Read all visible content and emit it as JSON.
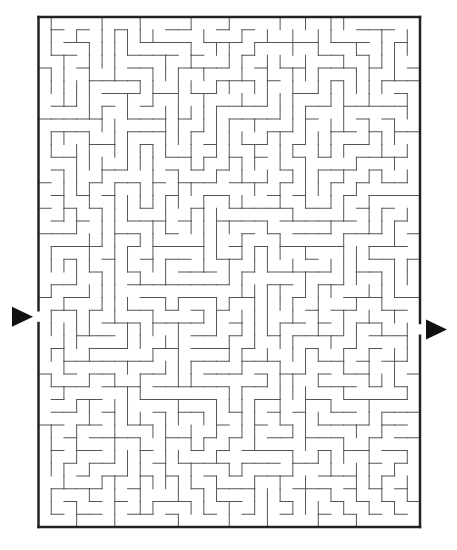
{
  "puzzle": {
    "type": "maze",
    "cols": 30,
    "rows": 40,
    "seed": 7341,
    "border": {
      "left": 38.5,
      "top": 17,
      "right": 420,
      "bottom": 527,
      "color": "#222222",
      "width": 2.5
    },
    "wall_color": "#555555",
    "wall_width": 1,
    "entrance": {
      "side": "left",
      "row": 23,
      "label": "start-arrow"
    },
    "exit": {
      "side": "right",
      "row": 24,
      "label": "finish-arrow"
    },
    "arrow_color": "#111111"
  }
}
